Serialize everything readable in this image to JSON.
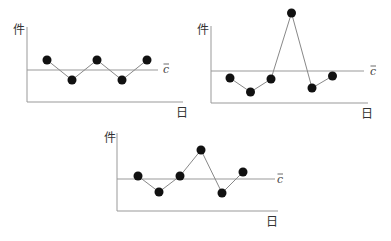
{
  "labels": {
    "y": "件",
    "x": "日",
    "center": "c"
  },
  "colors": {
    "axis": "#999999",
    "line": "#888888",
    "point": "#111111"
  },
  "chart_data": [
    {
      "type": "line",
      "title": "",
      "ylabel": "件",
      "xlabel": "日",
      "center_line_label": "c̄",
      "x": [
        1,
        2,
        3,
        4,
        5
      ],
      "values": [
        1,
        -1,
        1,
        -1,
        1
      ],
      "center_line": 0,
      "grid": false
    },
    {
      "type": "line",
      "title": "",
      "ylabel": "件",
      "xlabel": "日",
      "center_line_label": "c̄",
      "x": [
        1,
        2,
        3,
        4,
        5,
        6
      ],
      "values": [
        -0.7,
        -2.1,
        -0.8,
        5.8,
        -1.7,
        -0.5
      ],
      "center_line": 0,
      "grid": false
    },
    {
      "type": "line",
      "title": "",
      "ylabel": "件",
      "xlabel": "日",
      "center_line_label": "c̄",
      "x": [
        1,
        2,
        3,
        4,
        5,
        6
      ],
      "values": [
        0.3,
        -1.3,
        0.3,
        2.9,
        -1.4,
        0.7
      ],
      "center_line": 0,
      "grid": false
    }
  ]
}
